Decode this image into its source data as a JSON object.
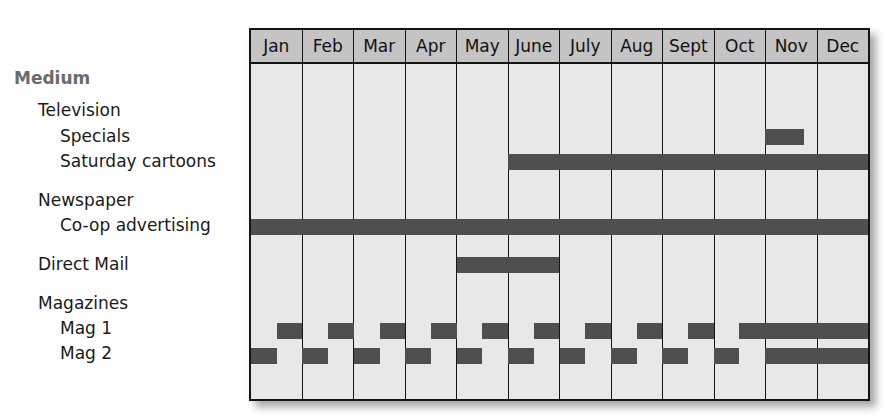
{
  "chart_data": {
    "type": "gantt",
    "title": "",
    "months": [
      "Jan",
      "Feb",
      "Mar",
      "Apr",
      "May",
      "June",
      "July",
      "Aug",
      "Sept",
      "Oct",
      "Nov",
      "Dec"
    ],
    "rows": [
      {
        "label": "Medium",
        "level": 0,
        "is_header": true
      },
      {
        "label": "Television",
        "level": 1
      },
      {
        "label": "Specials",
        "level": 2,
        "bars": [
          {
            "start": 10.0,
            "end": 10.75
          }
        ]
      },
      {
        "label": "Saturday cartoons",
        "level": 2,
        "bars": [
          {
            "start": 5.0,
            "end": 12.0
          }
        ]
      },
      {
        "label": "Newspaper",
        "level": 1
      },
      {
        "label": "Co-op advertising",
        "level": 2,
        "bars": [
          {
            "start": 0.0,
            "end": 12.0
          }
        ]
      },
      {
        "label": "Direct Mail",
        "level": 1,
        "bars": [
          {
            "start": 4.0,
            "end": 6.0
          }
        ]
      },
      {
        "label": "Magazines",
        "level": 1
      },
      {
        "label": "Mag 1",
        "level": 2,
        "bars": [
          {
            "start": 0.5,
            "end": 1.0
          },
          {
            "start": 1.5,
            "end": 2.0
          },
          {
            "start": 2.5,
            "end": 3.0
          },
          {
            "start": 3.5,
            "end": 4.0
          },
          {
            "start": 4.5,
            "end": 5.0
          },
          {
            "start": 5.5,
            "end": 6.0
          },
          {
            "start": 6.5,
            "end": 7.0
          },
          {
            "start": 7.5,
            "end": 8.0
          },
          {
            "start": 8.5,
            "end": 9.0
          },
          {
            "start": 9.5,
            "end": 12.0
          }
        ]
      },
      {
        "label": "Mag 2",
        "level": 2,
        "bars": [
          {
            "start": 0.0,
            "end": 0.5
          },
          {
            "start": 1.0,
            "end": 1.5
          },
          {
            "start": 2.0,
            "end": 2.5
          },
          {
            "start": 3.0,
            "end": 3.5
          },
          {
            "start": 4.0,
            "end": 4.5
          },
          {
            "start": 5.0,
            "end": 5.5
          },
          {
            "start": 6.0,
            "end": 6.5
          },
          {
            "start": 7.0,
            "end": 7.5
          },
          {
            "start": 8.0,
            "end": 8.5
          },
          {
            "start": 9.0,
            "end": 9.5
          },
          {
            "start": 10.0,
            "end": 12.0
          }
        ]
      }
    ],
    "colors": {
      "header_bg": "#c4c4c4",
      "grid_bg": "#e8e8e8",
      "bar": "#4f4f4f",
      "border": "#141414",
      "medium_label": "#6b6b6b"
    }
  }
}
